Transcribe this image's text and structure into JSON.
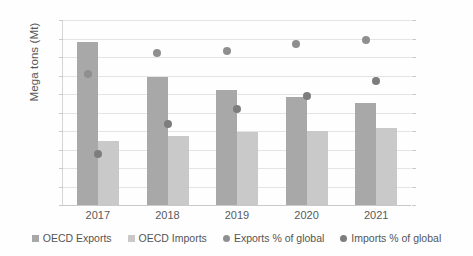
{
  "chart_data": {
    "type": "bar",
    "title": "",
    "xlabel": "",
    "ylabel": "Mega tons (Mt)",
    "categories": [
      "2017",
      "2018",
      "2019",
      "2020",
      "2021"
    ],
    "ylim": [
      0,
      10
    ],
    "y2lim": [
      0,
      100
    ],
    "y_ticks": [
      "0",
      "1",
      "2",
      "3",
      "4",
      "5",
      "6",
      "7",
      "8",
      "9",
      "10"
    ],
    "y2_ticks": [
      "0%",
      "10%",
      "20%",
      "30%",
      "40%",
      "50%",
      "60%",
      "70%",
      "80%",
      "90%",
      "100%"
    ],
    "grid": true,
    "legend_position": "bottom",
    "series": [
      {
        "name": "OECD Exports",
        "kind": "bar",
        "axis": "left",
        "color": "#a8a8a8",
        "values": [
          8.8,
          6.9,
          6.2,
          5.85,
          5.5
        ]
      },
      {
        "name": "OECD Imports",
        "kind": "bar",
        "axis": "left",
        "color": "#c9c9c9",
        "values": [
          3.45,
          3.75,
          3.95,
          4.0,
          4.15
        ]
      },
      {
        "name": "Exports % of global",
        "kind": "scatter",
        "axis": "right",
        "color": "#8f8f8f",
        "values": [
          71,
          82,
          83,
          87,
          89
        ]
      },
      {
        "name": "Imports % of global",
        "kind": "scatter",
        "axis": "right",
        "color": "#7d7d7d",
        "values": [
          27.5,
          44,
          52,
          59,
          67
        ]
      }
    ]
  },
  "axis": {
    "y_label": "Mega tons (Mt)"
  },
  "legend": {
    "items": [
      {
        "label": "OECD Exports",
        "marker": "square",
        "color": "#a8a8a8"
      },
      {
        "label": "OECD Imports",
        "marker": "square",
        "color": "#c9c9c9"
      },
      {
        "label": "Exports % of global",
        "marker": "circle",
        "color": "#8f8f8f"
      },
      {
        "label": "Imports % of global",
        "marker": "circle",
        "color": "#7d7d7d"
      }
    ]
  }
}
